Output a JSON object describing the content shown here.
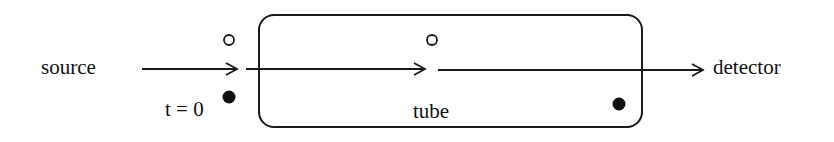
{
  "labels": {
    "source": "source",
    "time": "t = 0",
    "tube": "tube",
    "detector": "detector"
  },
  "colors": {
    "stroke": "#1a1a1a",
    "background": "#ffffff"
  }
}
